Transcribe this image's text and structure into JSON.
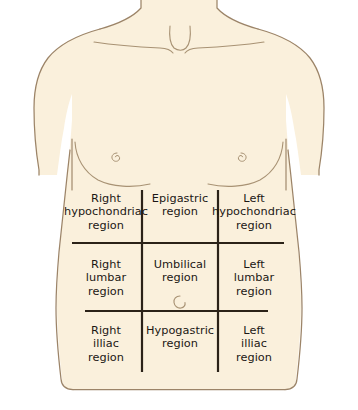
{
  "figure": {
    "view": "anterior",
    "colors": {
      "background": "#ffffff",
      "skin_fill": "#faf0dc",
      "body_outline": "#9c8468",
      "detail_line": "#a89274",
      "grid_line": "#2b2218",
      "label_text": "#1b1714"
    }
  },
  "anatomy": {
    "parts": [
      {
        "name": "neck",
        "label": "neck"
      },
      {
        "name": "suprasternal-notch",
        "label": "suprasternal notch"
      },
      {
        "name": "clavicle-left",
        "label": "left clavicle"
      },
      {
        "name": "clavicle-right",
        "label": "right clavicle"
      },
      {
        "name": "shoulder-left",
        "label": "left shoulder"
      },
      {
        "name": "shoulder-right",
        "label": "right shoulder"
      },
      {
        "name": "pectoral-left",
        "label": "left pectoral contour"
      },
      {
        "name": "pectoral-right",
        "label": "right pectoral contour"
      },
      {
        "name": "nipple-left",
        "label": "left nipple"
      },
      {
        "name": "nipple-right",
        "label": "right nipple"
      },
      {
        "name": "umbilicus",
        "label": "umbilicus"
      },
      {
        "name": "torso",
        "label": "torso"
      }
    ]
  },
  "grid": {
    "rows": 3,
    "columns": 3,
    "vertical_lines": 2,
    "horizontal_lines": 2,
    "line_names": [
      "left-midclavicular-line",
      "right-midclavicular-line",
      "subcostal-plane",
      "intertubercular-plane"
    ]
  },
  "regions": [
    {
      "id": "right-hypochondriac",
      "row": 0,
      "col": 0,
      "label": "Right\nhypochondriac\nregion"
    },
    {
      "id": "epigastric",
      "row": 0,
      "col": 1,
      "label": "Epigastric\nregion"
    },
    {
      "id": "left-hypochondriac",
      "row": 0,
      "col": 2,
      "label": "Left\nhypochondriac\nregion"
    },
    {
      "id": "right-lumbar",
      "row": 1,
      "col": 0,
      "label": "Right\nlumbar\nregion"
    },
    {
      "id": "umbilical",
      "row": 1,
      "col": 1,
      "label": "Umbilical\nregion"
    },
    {
      "id": "left-lumbar",
      "row": 1,
      "col": 2,
      "label": "Left\nlumbar\nregion"
    },
    {
      "id": "right-illiac",
      "row": 2,
      "col": 0,
      "label": "Right\nilliac\nregion"
    },
    {
      "id": "hypogastric",
      "row": 2,
      "col": 1,
      "label": "Hypogastric\nregion"
    },
    {
      "id": "left-illiac",
      "row": 2,
      "col": 2,
      "label": "Left\nilliac\nregion"
    }
  ]
}
